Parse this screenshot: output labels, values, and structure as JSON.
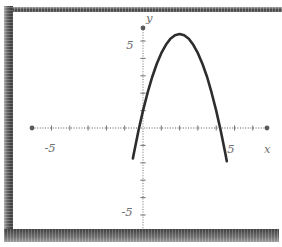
{
  "graph": {
    "x_axis_label": "x",
    "y_axis_label": "y",
    "x_tick_labels": {
      "neg": "-5",
      "pos": "5"
    },
    "y_tick_labels": {
      "pos": "5",
      "neg": "-5"
    }
  },
  "colors": {
    "curve": "#2d2d2d",
    "axis": "#8f8f8f",
    "tick": "#7a7a7a",
    "label": "#6e6e6e",
    "frame_dark": "#3f3f3f",
    "frame_light": "#9c9c9c",
    "background": "#ffffff"
  },
  "chart_data": {
    "type": "line",
    "title": "",
    "xlabel": "x",
    "ylabel": "y",
    "xlim": [
      -6.8,
      6.8
    ],
    "ylim": [
      -6.3,
      6.3
    ],
    "grid": false,
    "legend": false,
    "x_tick_step": 1,
    "y_tick_step": 1,
    "x_ticks": [
      -5,
      -4,
      -3,
      -2,
      -1,
      1,
      2,
      3,
      4,
      5,
      6
    ],
    "y_ticks": [
      -6,
      -5,
      -4,
      -3,
      -2,
      -1,
      1,
      2,
      3,
      4,
      5
    ],
    "labeled_ticks": {
      "x": [
        -5,
        5
      ],
      "y": [
        -5,
        5
      ]
    },
    "series": [
      {
        "name": "parabola",
        "description": "Downward-opening parabola, vertex near (2, 5.4), x-intercepts near x = -0.2 and x = 4.2",
        "function": "y = -1.1(x-2)^2 + 5.4",
        "x_domain": [
          -0.55,
          4.58
        ],
        "points": [
          [
            -0.55,
            -1.75
          ],
          [
            -0.5,
            -1.48
          ],
          [
            -0.25,
            -0.17
          ],
          [
            0,
            1.0
          ],
          [
            0.25,
            2.03
          ],
          [
            0.5,
            2.93
          ],
          [
            0.75,
            3.68
          ],
          [
            1,
            4.3
          ],
          [
            1.25,
            4.78
          ],
          [
            1.5,
            5.13
          ],
          [
            1.75,
            5.33
          ],
          [
            2,
            5.4
          ],
          [
            2.25,
            5.33
          ],
          [
            2.5,
            5.13
          ],
          [
            2.75,
            4.78
          ],
          [
            3,
            4.3
          ],
          [
            3.25,
            3.68
          ],
          [
            3.5,
            2.93
          ],
          [
            3.75,
            2.03
          ],
          [
            4,
            1.0
          ],
          [
            4.25,
            -0.17
          ],
          [
            4.5,
            -1.48
          ],
          [
            4.58,
            -1.91
          ]
        ]
      }
    ]
  }
}
